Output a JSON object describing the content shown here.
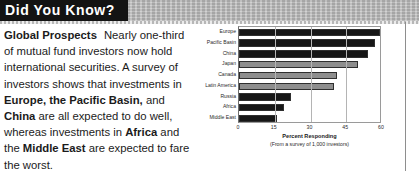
{
  "header": {
    "title": "Did You Know?"
  },
  "article": {
    "lead_in": "Global Prospects",
    "body_segments": [
      {
        "text": "Nearly one-third of mutual fund investors now hold international securities. A survey of investors shows that investments in ",
        "bold": false
      },
      {
        "text": "Europe, the Pacific Basin,",
        "bold": true
      },
      {
        "text": " and ",
        "bold": false
      },
      {
        "text": "China",
        "bold": true
      },
      {
        "text": " are all expected to do well, whereas investments in ",
        "bold": false
      },
      {
        "text": "Africa",
        "bold": true
      },
      {
        "text": " and the ",
        "bold": false
      },
      {
        "text": "Middle East",
        "bold": true
      },
      {
        "text": " are expected to fare the worst.",
        "bold": false
      }
    ]
  },
  "chart_data": {
    "type": "bar",
    "orientation": "horizontal",
    "title": "",
    "xlabel": "Percent Responding",
    "ylabel": "",
    "note": "(From a survey of 1,000 investors)",
    "xlim": [
      0,
      60
    ],
    "xticks": [
      0,
      15,
      30,
      45,
      60
    ],
    "grid": true,
    "legend": false,
    "categories": [
      "Europe",
      "Pacific Basin",
      "China",
      "Japan",
      "Canada",
      "Latin America",
      "Russia",
      "Africa",
      "Middle East"
    ],
    "values": [
      60,
      57,
      54,
      50,
      41,
      40,
      22,
      19,
      16
    ],
    "bar_shades": [
      "dark",
      "dark",
      "dark",
      "light",
      "light",
      "light",
      "dark",
      "dark",
      "dark"
    ]
  },
  "colors": {
    "title_block": "#131313",
    "title_text": "#ffffff",
    "bar_dark": "#161616",
    "bar_light": "#8e8e8e",
    "header_band": "#b9b9b9"
  }
}
